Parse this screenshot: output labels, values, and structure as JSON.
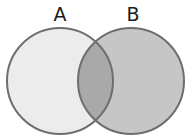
{
  "diagram": {
    "type": "venn",
    "sets": [
      {
        "label": "A",
        "cx": 60,
        "cy": 81,
        "r": 53,
        "fill": "#ececec"
      },
      {
        "label": "B",
        "cx": 131,
        "cy": 81,
        "r": 53,
        "fill": "#c6c6c6"
      }
    ],
    "intersection_fill": "#a9a9a9",
    "stroke": "#6e6e6e"
  }
}
